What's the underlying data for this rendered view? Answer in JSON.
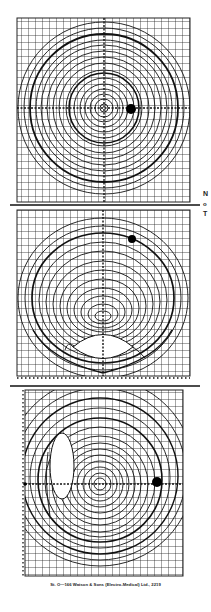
{
  "document": {
    "type": "Isodose chart sheet",
    "side_labels": [
      "N",
      "o",
      "T"
    ],
    "footer": "St. O—166 Watson & Sons (Electro-Medical) Ltd., 2219"
  },
  "panels": [
    {
      "name": "isodose-chart-1",
      "grid": {
        "x": 17,
        "y": 18,
        "w": 173,
        "h": 184,
        "cell": 7
      },
      "center": [
        104,
        108
      ],
      "curves": "concentric circles",
      "source_dot": [
        131,
        109
      ]
    },
    {
      "name": "isodose-chart-2",
      "grid": {
        "x": 17,
        "y": 210,
        "w": 173,
        "h": 166,
        "cell": 7
      },
      "center": [
        103,
        316
      ],
      "curves": "concentric ellipses with lower lens-shaped region",
      "source_dot": [
        132,
        239
      ],
      "scale_ticks": "numbered scale along bottom edge"
    },
    {
      "name": "isodose-chart-3",
      "grid": {
        "x": 25,
        "y": 390,
        "w": 158,
        "h": 186,
        "cell": 7
      },
      "center": [
        100,
        484
      ],
      "curves": "concentric circles with left elliptical region",
      "source_dot": [
        157,
        482
      ],
      "scale_ticks": "numbered scale along left edge"
    }
  ],
  "dividers": [
    205,
    386
  ]
}
